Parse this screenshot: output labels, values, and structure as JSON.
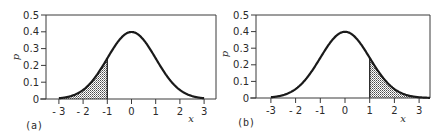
{
  "chart_data": [
    {
      "type": "area",
      "panel_label": "(a)",
      "title": "",
      "xlabel": "x",
      "ylabel": "p",
      "xlim": [
        -3.5,
        3.5
      ],
      "ylim": [
        0,
        0.5
      ],
      "xticks": [
        -3,
        -2,
        -1,
        0,
        1,
        2,
        3
      ],
      "xtick_labels": [
        "- 3",
        "- 2",
        "-1",
        "0",
        "1",
        "2",
        "3"
      ],
      "yticks": [
        0,
        0.1,
        0.2,
        0.3,
        0.4,
        0.5
      ],
      "ytick_labels": [
        "0",
        "0.1",
        "0.2",
        "0.3",
        "0.4",
        "0.5"
      ],
      "grid": false,
      "curve": "standard normal density, peak 0.4 at x=0",
      "x": [
        -3,
        -2.5,
        -2,
        -1.5,
        -1,
        -0.5,
        0,
        0.5,
        1,
        1.5,
        2,
        2.5,
        3
      ],
      "y": [
        0.004,
        0.018,
        0.054,
        0.13,
        0.242,
        0.352,
        0.399,
        0.352,
        0.242,
        0.13,
        0.054,
        0.018,
        0.004
      ],
      "shaded_region": {
        "from": -3,
        "to": -1,
        "pattern": "stippled"
      }
    },
    {
      "type": "area",
      "panel_label": "(b)",
      "title": "",
      "xlabel": "x",
      "ylabel": "p",
      "xlim": [
        -3.5,
        3.5
      ],
      "ylim": [
        0,
        0.5
      ],
      "xticks": [
        -3,
        -2,
        -1,
        0,
        1,
        2,
        3
      ],
      "xtick_labels": [
        "-3",
        "- 2",
        "-1",
        "0",
        "1",
        "2",
        "3"
      ],
      "yticks": [
        0,
        0.1,
        0.2,
        0.3,
        0.4,
        0.5
      ],
      "ytick_labels": [
        "0",
        "0.1",
        "0.2",
        "0.3",
        "0.4",
        "0.5"
      ],
      "grid": false,
      "curve": "standard normal density, peak 0.4 at x=0",
      "x": [
        -3,
        -2.5,
        -2,
        -1.5,
        -1,
        -0.5,
        0,
        0.5,
        1,
        1.5,
        2,
        2.5,
        3
      ],
      "y": [
        0.004,
        0.018,
        0.054,
        0.13,
        0.242,
        0.352,
        0.399,
        0.352,
        0.242,
        0.13,
        0.054,
        0.018,
        0.004
      ],
      "shaded_region": {
        "from": 1,
        "to": 3.4,
        "pattern": "stippled"
      }
    }
  ],
  "panels": [
    {
      "frame": {
        "left": 46,
        "top": 15,
        "right": 216,
        "bottom": 99
      },
      "x0px": 131.5,
      "pxPerX": 24.2,
      "shade": [
        -3.0,
        -1.0
      ],
      "ylabelPos": [
        19,
        57
      ],
      "xlabelPos": [
        191,
        122
      ],
      "panelLabelPos": [
        25,
        129
      ],
      "tickLabelY": 115
    },
    {
      "frame": {
        "left": 256,
        "top": 15,
        "right": 430,
        "bottom": 98
      },
      "x0px": 345,
      "pxPerX": 24.7,
      "shade": [
        1.0,
        3.45
      ],
      "ylabelPos": [
        228,
        54
      ],
      "xlabelPos": [
        403,
        122
      ],
      "panelLabelPos": [
        237,
        126
      ],
      "tickLabelY": 114
    }
  ],
  "colors": {
    "ink": "#1a1a1a",
    "frame": "#3a3a3a",
    "shade_dot": "#555555"
  }
}
